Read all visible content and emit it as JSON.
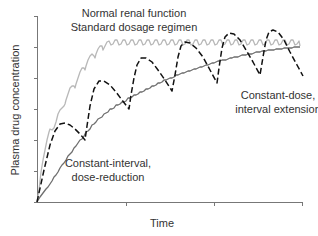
{
  "chart_data": {
    "type": "line",
    "title": "",
    "xlabel": "Time",
    "ylabel": "Plasma drug concentration",
    "x_ticks": [
      "",
      "",
      "",
      ""
    ],
    "y_ticks": [
      "",
      "",
      "",
      "",
      "",
      "",
      ""
    ],
    "xlim": [
      0,
      3
    ],
    "ylim": [
      0,
      6
    ],
    "grid": false,
    "legend": "inline annotations",
    "annotations": [
      {
        "text": "Normal renal function",
        "line": 1
      },
      {
        "text": "Standard dosage regimen",
        "line": 2
      },
      {
        "text": "Constant-dose,",
        "line": 1
      },
      {
        "text": "interval extension",
        "line": 2
      },
      {
        "text": "Constant-interval,",
        "line": 1
      },
      {
        "text": "dose-reduction",
        "line": 2
      }
    ],
    "series": [
      {
        "name": "Normal renal function, standard dosage regimen",
        "style": "solid",
        "color": "#b8b8b8",
        "x": [
          0,
          0.1,
          0.2,
          0.3,
          0.4,
          0.5,
          0.6,
          0.8,
          1.0,
          1.5,
          2.0,
          2.5,
          3.0
        ],
        "y": [
          0,
          1.9,
          3.0,
          3.7,
          4.2,
          4.6,
          4.9,
          5.1,
          5.2,
          5.2,
          5.2,
          5.2,
          5.2
        ]
      },
      {
        "name": "Constant-interval, dose-reduction",
        "style": "solid",
        "color": "#6e6e6e",
        "x": [
          0,
          0.25,
          0.5,
          0.75,
          1.0,
          1.25,
          1.5,
          1.75,
          2.0,
          2.25,
          2.5,
          2.75,
          3.0
        ],
        "y": [
          0,
          1.1,
          2.0,
          2.7,
          3.2,
          3.6,
          3.9,
          4.15,
          4.35,
          4.5,
          4.65,
          4.75,
          4.85
        ]
      },
      {
        "name": "Constant-dose, interval extension",
        "style": "dashed",
        "color": "#111111",
        "x": [
          0,
          0.26,
          0.54,
          0.7,
          0.93,
          1.04,
          1.17,
          1.42,
          1.53,
          1.66,
          1.92,
          2.03,
          2.13,
          2.51,
          2.64,
          3.0
        ],
        "y": [
          0,
          2.55,
          2.0,
          3.9,
          2.4,
          3.1,
          4.5,
          3.5,
          4.8,
          5.1,
          3.8,
          5.5,
          4.1,
          5.6,
          4.1,
          4.1
        ]
      }
    ]
  },
  "plot": {
    "ylabel": "Plasma drug concentration",
    "xlabel": "Time",
    "ann_normal_1": "Normal renal function",
    "ann_normal_2": "Standard dosage regimen",
    "ann_interval_1": "Constant-dose,",
    "ann_interval_2": "interval extension",
    "ann_dose_1": "Constant-interval,",
    "ann_dose_2": "dose-reduction",
    "colors": {
      "normal": "#b8b8b8",
      "dose_reduction": "#6e6e6e",
      "interval_extension": "#111111",
      "axis": "#777777",
      "text": "#333333"
    },
    "paths": {
      "normal": "M37,202 L39,190 L41,172 L43,160 L45,150 L47,140 L49,132 L50,129 L52,130 L54,128 L56,122 L58,114 L60,110 L62,108 L64,106 L65,104 L66,100 L68,94 L70,88 L72,86 L74,86 L75,88 L76,84 L78,78 L80,72 L82,68 L84,68 L85,70 L86,66 L88,60 L90,56 L92,54 L94,56 L95,58 L96,54 L98,49 L100,46 L102,46 L103,50 L105,46 L107,42 L109,41 L111,45 L113,44 L115,40 L117,40 L119,45 L121,44 L123,40 L125,40 L127,45 L129,44 L131,40 L133,40 L135,45 L137,44 L139,40 L141,40 L143,45 L145,44 L147,40 L149,40 L151,45 L153,44 L155,40 L157,40 L159,45 L161,44 L163,40 L165,40 L167,45 L169,44 L171,40 L173,40 L175,45 L177,44 L179,40 L181,40 L183,45 L185,44 L187,40 L189,40 L191,45 L193,44 L195,40 L197,40 L199,45 L201,44 L203,40 L205,40 L207,45 L209,44 L211,40 L213,40 L215,45 L217,44 L219,40 L221,40 L223,45 L225,44 L227,40 L229,40 L231,45 L233,44 L235,40 L237,40 L239,45 L241,44 L243,40 L245,40 L247,45 L249,44 L251,40 L253,40 L255,45 L257,44 L259,40 L261,40 L263,45 L265,44 L267,40 L269,40 L271,45 L273,44 L275,40 L277,40 L279,45 L281,44 L283,40 L285,40 L287,45 L289,44 L291,40 L293,40 L295,45 L297,44 L299,41 L300,46",
      "dose": "M37,202 L40,197 L43,193 L46,189 L48,187 L50,184 L52,181 L54,177 L56,175 L58,172 L60,168 L62,165 L64,163 L66,160 L68,156 L70,154 L72,152 L74,148 L76,146 L78,143 L80,140 L82,139 L84,136 L86,132 L88,131 L90,129 L92,125 L94,124 L96,122 L98,119 L100,118 L102,117 L104,114 L106,113 L108,112 L110,109 L112,109 L114,108 L116,105 L118,105 L120,104 L122,102 L124,102 L126,101 L128,98 L130,98 L132,97 L134,95 L136,95 L138,94 L140,92 L142,92 L144,91 L146,89 L148,89 L150,88 L152,86 L154,86 L156,85 L158,83 L160,83 L162,82 L164,80 L166,80 L168,79 L170,78 L172,78 L174,77 L176,75 L178,75 L180,74 L182,73 L184,73 L186,72 L188,71 L190,71 L192,70 L194,69 L196,69 L198,68 L200,67 L202,67 L204,66 L206,65 L208,65 L210,64 L212,63 L214,63 L216,62 L218,61 L220,61 L222,60 L224,60 L226,60 L228,59 L230,58 L232,58 L234,57 L236,57 L238,57 L240,56 L242,55 L244,55 L246,55 L248,54 L250,54 L252,54 L254,53 L256,52 L258,52 L260,52 L262,51 L264,51 L266,51 L268,50 L270,50 L272,50 L274,50 L276,49 L278,49 L280,49 L282,49 L284,48 L286,48 L288,48 L290,48 L292,48 L294,47 L296,47 L298,47 L300,47",
      "interval": "M37,202 L44,170 L50,145 L55,131 L60,124 L65,123 L70,125 L75,129 L80,134 L85,140 L87,126 L90,106 L94,89 L99,81 L104,81 L110,85 L116,92 L122,100 L129,109 L131,95 L134,78 L137,65 L141,58 L146,58 L152,62 L158,70 L165,80 L172,91 L175,75 L178,57 L181,46 L185,42 L190,43 L196,48 L203,57 L210,70 L217,83 L219,68 L222,48 L225,37 L229,33 L234,34 L240,40 L246,50 L253,62 L260,75 L263,57 L266,40 L269,32 L273,30 L278,32 L284,40 L290,52 L297,65 L303,76"
    }
  }
}
